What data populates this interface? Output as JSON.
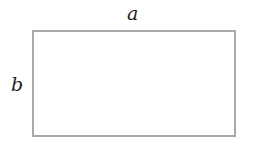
{
  "diagram": {
    "shape": "rectangle",
    "stroke_color": "#a9a9a9",
    "fill_color": "#ffffff",
    "labels": {
      "top": "a",
      "left": "b"
    }
  }
}
